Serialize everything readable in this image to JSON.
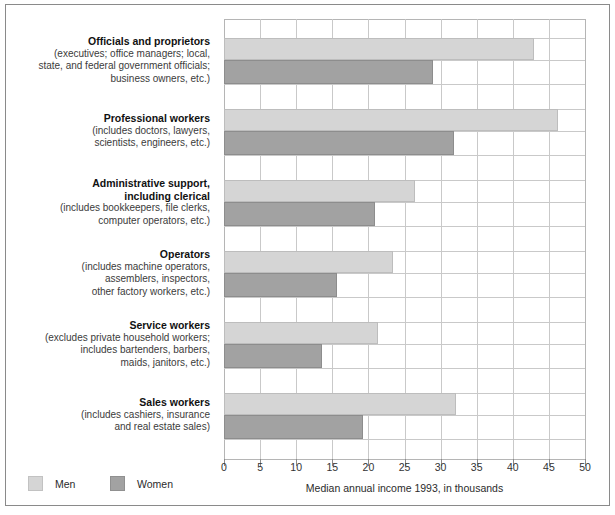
{
  "chart_data": {
    "type": "bar",
    "orientation": "horizontal",
    "title": "",
    "xlabel": "Median annual income 1993, in thousands",
    "ylabel": "",
    "xlim": [
      0,
      50
    ],
    "xticks": [
      0,
      5,
      10,
      15,
      20,
      25,
      30,
      35,
      40,
      45,
      50
    ],
    "xtick_labels": [
      "0",
      "5",
      "10",
      "15",
      "20",
      "25",
      "30",
      "35",
      "40",
      "45",
      "50"
    ],
    "grid": true,
    "legend_position": "bottom-left",
    "categories": [
      "Officials and proprietors",
      "Professional workers",
      "Administrative support, including clerical",
      "Operators",
      "Service workers",
      "Sales workers"
    ],
    "series": [
      {
        "name": "Men",
        "color": "#d5d5d5",
        "values": [
          43.0,
          46.3,
          26.5,
          23.4,
          21.3,
          32.1
        ]
      },
      {
        "name": "Women",
        "color": "#a2a2a2",
        "values": [
          29.0,
          31.9,
          20.9,
          15.6,
          13.6,
          19.3
        ]
      }
    ]
  },
  "categories": [
    {
      "title": "Officials and proprietors",
      "sub": [
        "(executives; office managers; local,",
        "state, and federal government officials;",
        "business owners, etc.)"
      ],
      "men": 43.0,
      "women": 29.0
    },
    {
      "title": "Professional workers",
      "sub": [
        "(includes doctors, lawyers,",
        "scientists, engineers, etc.)"
      ],
      "men": 46.3,
      "women": 31.9
    },
    {
      "title_lines": [
        "Administrative support,",
        "including clerical"
      ],
      "title": "Administrative support, including clerical",
      "sub": [
        "(includes bookkeepers, file clerks,",
        "computer operators, etc.)"
      ],
      "men": 26.5,
      "women": 20.9
    },
    {
      "title": "Operators",
      "sub": [
        "(includes machine operators,",
        "assemblers, inspectors,",
        "other factory workers, etc.)"
      ],
      "men": 23.4,
      "women": 15.6
    },
    {
      "title": "Service workers",
      "sub": [
        "(excludes private household workers;",
        "includes bartenders, barbers,",
        "maids, janitors, etc.)"
      ],
      "men": 21.3,
      "women": 13.6
    },
    {
      "title": "Sales workers",
      "sub": [
        "(includes cashiers, insurance",
        "and real estate sales)"
      ],
      "men": 32.1,
      "women": 19.3
    }
  ],
  "axis": {
    "tick_labels": [
      "0",
      "5",
      "10",
      "15",
      "20",
      "25",
      "30",
      "35",
      "40",
      "45",
      "50"
    ],
    "title": "Median annual income 1993, in thousands"
  },
  "legend": {
    "men_label": "Men",
    "women_label": "Women",
    "men_color": "#d5d5d5",
    "women_color": "#a2a2a2"
  }
}
